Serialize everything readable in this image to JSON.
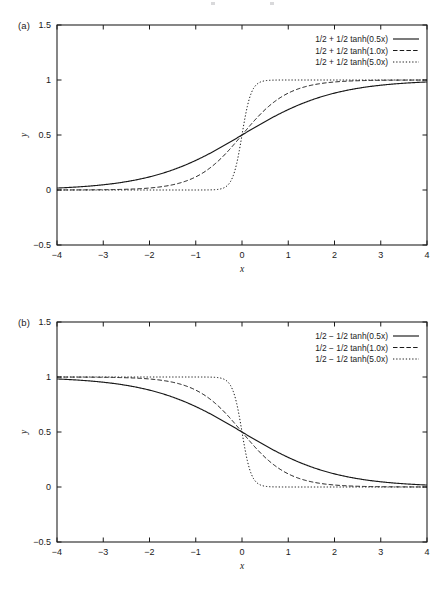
{
  "figure": {
    "panels": [
      {
        "id": "a",
        "label": "(a)",
        "axis": {
          "xlabel": "x",
          "ylabel": "y",
          "xlim": [
            -4,
            4
          ],
          "ylim": [
            -0.5,
            1.5
          ],
          "xticks": [
            -4,
            -3,
            -2,
            -1,
            0,
            1,
            2,
            3,
            4
          ],
          "xticklabels": [
            "-4",
            "-3",
            "-2",
            "-1",
            "0",
            "1",
            "2",
            "3",
            "4"
          ],
          "yticks": [
            -0.5,
            0,
            0.5,
            1,
            1.5
          ],
          "yticklabels": [
            "-0.5",
            "0",
            "0.5",
            "1",
            "1.5"
          ],
          "grid": false,
          "frame": "box",
          "tick_direction": "in"
        },
        "legend": {
          "position": "upper right",
          "entries": [
            {
              "label": "1/2 + 1/2 tanh(0.5x)",
              "style": "solid"
            },
            {
              "label": "1/2 + 1/2 tanh(1.0x)",
              "style": "dashed"
            },
            {
              "label": "1/2 + 1/2 tanh(5.0x)",
              "style": "dotted"
            }
          ]
        }
      },
      {
        "id": "b",
        "label": "(b)",
        "axis": {
          "xlabel": "x",
          "ylabel": "y",
          "xlim": [
            -4,
            4
          ],
          "ylim": [
            -0.5,
            1.5
          ],
          "xticks": [
            -4,
            -3,
            -2,
            -1,
            0,
            1,
            2,
            3,
            4
          ],
          "xticklabels": [
            "-4",
            "-3",
            "-2",
            "-1",
            "0",
            "1",
            "2",
            "3",
            "4"
          ],
          "yticks": [
            -0.5,
            0,
            0.5,
            1,
            1.5
          ],
          "yticklabels": [
            "-0.5",
            "0",
            "0.5",
            "1",
            "1.5"
          ],
          "grid": false,
          "frame": "box",
          "tick_direction": "in"
        },
        "legend": {
          "position": "upper right",
          "entries": [
            {
              "label": "1/2 − 1/2 tanh(0.5x)",
              "style": "solid"
            },
            {
              "label": "1/2 − 1/2 tanh(1.0x)",
              "style": "dashed"
            },
            {
              "label": "1/2 − 1/2 tanh(5.0x)",
              "style": "dotted"
            }
          ]
        }
      }
    ]
  },
  "chart_data": [
    {
      "type": "line",
      "panel": "a",
      "title": "",
      "xlabel": "x",
      "ylabel": "y",
      "xlim": [
        -4,
        4
      ],
      "ylim": [
        -0.5,
        1.5
      ],
      "xticks": [
        -4,
        -3,
        -2,
        -1,
        0,
        1,
        2,
        3,
        4
      ],
      "yticks": [
        -0.5,
        0,
        0.5,
        1,
        1.5
      ],
      "grid": false,
      "legend_position": "upper right",
      "x": [
        -4,
        -3.75,
        -3.5,
        -3.25,
        -3,
        -2.75,
        -2.5,
        -2.25,
        -2,
        -1.75,
        -1.5,
        -1.25,
        -1,
        -0.75,
        -0.5,
        -0.25,
        0,
        0.25,
        0.5,
        0.75,
        1,
        1.25,
        1.5,
        1.75,
        2,
        2.25,
        2.5,
        2.75,
        3,
        3.25,
        3.5,
        3.75,
        4
      ],
      "series": [
        {
          "name": "1/2 + 1/2 tanh(0.5x)",
          "style": "solid",
          "color": "#1a1a1a",
          "values": [
            0.018,
            0.0225,
            0.028,
            0.0349,
            0.0434,
            0.0538,
            0.0667,
            0.0825,
            0.1017,
            0.1251,
            0.1533,
            0.1871,
            0.2689,
            0.2689,
            0.3208,
            0.3775,
            0.5,
            0.6225,
            0.6792,
            0.7311,
            0.7311,
            0.8129,
            0.8467,
            0.8749,
            0.8983,
            0.9175,
            0.9333,
            0.9462,
            0.9566,
            0.9651,
            0.972,
            0.9775,
            0.982
          ]
        },
        {
          "name": "1/2 + 1/2 tanh(1.0x)",
          "style": "dashed",
          "color": "#1a1a1a",
          "values": [
            0.00034,
            0.00055,
            0.00091,
            0.0015,
            0.00247,
            0.00407,
            0.00669,
            0.01099,
            0.01799,
            0.02931,
            0.04743,
            0.07586,
            0.1192,
            0.18243,
            0.26894,
            0.37754,
            0.5,
            0.62246,
            0.73106,
            0.81757,
            0.8808,
            0.92414,
            0.95257,
            0.97069,
            0.98201,
            0.98901,
            0.99331,
            0.99593,
            0.99753,
            0.9985,
            0.99909,
            0.99945,
            0.99966
          ]
        },
        {
          "name": "1/2 + 1/2 tanh(5.0x)",
          "style": "dotted",
          "color": "#1a1a1a",
          "values": [
            0.0,
            0.0,
            0.0,
            1e-07,
            3e-07,
            1.1e-06,
            3.7e-06,
            1.27e-05,
            4.54e-05,
            0.0001583,
            0.0005527,
            0.0019267,
            0.0066929,
            0.0231472,
            0.0758582,
            0.2227001,
            0.5,
            0.7772999,
            0.9241418,
            0.9768528,
            0.9933071,
            0.9980733,
            0.9994473,
            0.9998417,
            0.9999546,
            0.9999873,
            0.9999963,
            0.9999989,
            0.9999997,
            0.9999999,
            1.0,
            1.0,
            1.0
          ]
        }
      ]
    },
    {
      "type": "line",
      "panel": "b",
      "title": "",
      "xlabel": "x",
      "ylabel": "y",
      "xlim": [
        -4,
        4
      ],
      "ylim": [
        -0.5,
        1.5
      ],
      "xticks": [
        -4,
        -3,
        -2,
        -1,
        0,
        1,
        2,
        3,
        4
      ],
      "yticks": [
        -0.5,
        0,
        0.5,
        1,
        1.5
      ],
      "grid": false,
      "legend_position": "upper right",
      "x": [
        -4,
        -3.75,
        -3.5,
        -3.25,
        -3,
        -2.75,
        -2.5,
        -2.25,
        -2,
        -1.75,
        -1.5,
        -1.25,
        -1,
        -0.75,
        -0.5,
        -0.25,
        0,
        0.25,
        0.5,
        0.75,
        1,
        1.25,
        1.5,
        1.75,
        2,
        2.25,
        2.5,
        2.75,
        3,
        3.25,
        3.5,
        3.75,
        4
      ],
      "series": [
        {
          "name": "1/2 − 1/2 tanh(0.5x)",
          "style": "solid",
          "color": "#1a1a1a",
          "values": [
            0.982,
            0.9775,
            0.972,
            0.9651,
            0.9566,
            0.9462,
            0.9333,
            0.9175,
            0.8983,
            0.8749,
            0.8467,
            0.8129,
            0.7311,
            0.7311,
            0.6792,
            0.6225,
            0.5,
            0.3775,
            0.3208,
            0.2689,
            0.2689,
            0.1871,
            0.1533,
            0.1251,
            0.1017,
            0.0825,
            0.0667,
            0.0538,
            0.0434,
            0.0349,
            0.028,
            0.0225,
            0.018
          ]
        },
        {
          "name": "1/2 − 1/2 tanh(1.0x)",
          "style": "dashed",
          "color": "#1a1a1a",
          "values": [
            0.99966,
            0.99945,
            0.99909,
            0.9985,
            0.99753,
            0.99593,
            0.99331,
            0.98901,
            0.98201,
            0.97069,
            0.95257,
            0.92414,
            0.8808,
            0.81757,
            0.73106,
            0.62246,
            0.5,
            0.37754,
            0.26894,
            0.18243,
            0.1192,
            0.07586,
            0.04743,
            0.02931,
            0.01799,
            0.01099,
            0.00669,
            0.00407,
            0.00247,
            0.0015,
            0.00091,
            0.00055,
            0.00034
          ]
        },
        {
          "name": "1/2 − 1/2 tanh(5.0x)",
          "style": "dotted",
          "color": "#1a1a1a",
          "values": [
            1.0,
            1.0,
            1.0,
            0.9999999,
            0.9999997,
            0.9999989,
            0.9999963,
            0.9999873,
            0.9999546,
            0.9998417,
            0.9994473,
            0.9980733,
            0.9933071,
            0.9768528,
            0.9241418,
            0.7772999,
            0.5,
            0.2227001,
            0.0758582,
            0.0231472,
            0.0066929,
            0.0019267,
            0.0005527,
            0.0001583,
            4.54e-05,
            1.27e-05,
            3.7e-06,
            1.1e-06,
            3e-07,
            1e-07,
            0.0,
            0.0,
            0.0
          ]
        }
      ]
    }
  ]
}
